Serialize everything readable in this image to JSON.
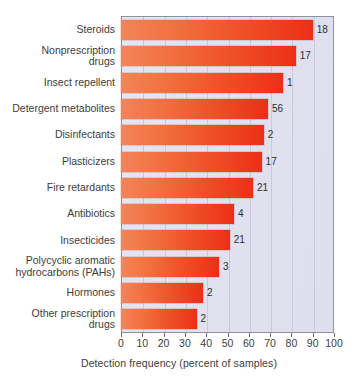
{
  "chart_data": {
    "type": "bar",
    "orientation": "horizontal",
    "title": "",
    "xlabel": "Detection frequency (percent of samples)",
    "ylabel": "",
    "xlim": [
      0,
      100
    ],
    "xticks": [
      0,
      10,
      20,
      30,
      40,
      50,
      60,
      70,
      80,
      90,
      100
    ],
    "xtick_labels": [
      "0",
      "10",
      "20",
      "30",
      "40",
      "50",
      "60",
      "70",
      "80",
      "90",
      "100"
    ],
    "grid": true,
    "legend": "none",
    "categories": [
      "Steroids",
      "Nonprescription\ndrugs",
      "Insect repellent",
      "Detergent metabolites",
      "Disinfectants",
      "Plasticizers",
      "Fire retardants",
      "Antibiotics",
      "Insecticides",
      "Polycyclic aromatic\nhydrocarbons (PAHs)",
      "Hormones",
      "Other prescription\ndrugs"
    ],
    "values": [
      90,
      82,
      76,
      69,
      67,
      66,
      62,
      53,
      51,
      46,
      38.5,
      35.5
    ],
    "point_labels": [
      "18",
      "17",
      "1",
      "56",
      "2",
      "17",
      "21",
      "4",
      "21",
      "3",
      "2",
      "2"
    ],
    "bar_color_start": "#f4845a",
    "bar_color_end": "#ec2f17",
    "plot_background": "#e3e3ef",
    "gridline_color": "#c9c9dc",
    "axis_color": "#8f8f9e"
  }
}
